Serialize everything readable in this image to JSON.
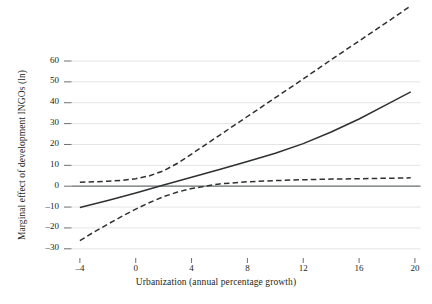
{
  "chart_data": {
    "type": "line",
    "title": "",
    "xlabel": "Urbanization (annual percentage growth)",
    "ylabel": "Marginal effect of development INGOs (ln)",
    "xlim": [
      -4.6,
      20.4
    ],
    "ylim": [
      -33,
      88
    ],
    "xticks": [
      -4,
      0,
      4,
      8,
      12,
      16,
      20
    ],
    "xtick_labels": [
      "–4",
      "0",
      "4",
      "8",
      "12",
      "16",
      "20"
    ],
    "yticks": [
      -30,
      -20,
      -10,
      0,
      10,
      20,
      30,
      40,
      50,
      60
    ],
    "ytick_labels": [
      "–30",
      "–20",
      "–10",
      "0",
      "10",
      "20",
      "30",
      "40",
      "50",
      "60"
    ],
    "grid": true,
    "grid_axis": "y",
    "grid_color": "#d9dadb",
    "legend": "none",
    "zero_line": {
      "value": 0,
      "style": "solid",
      "color": "#6e7072",
      "x_start": -4.6,
      "x_end": 20.4
    },
    "series": [
      {
        "name": "Marginal effect",
        "style": "solid",
        "color": "#2f3032",
        "width": 1.5,
        "x": [
          -4,
          -2,
          0,
          2,
          4,
          6,
          8,
          10,
          12,
          14,
          16,
          18,
          19.7
        ],
        "values": [
          -10.2,
          -6.9,
          -3.3,
          0.6,
          4.3,
          8.0,
          11.8,
          15.8,
          20.4,
          26.0,
          32.2,
          39.2,
          45.2
        ]
      },
      {
        "name": "Upper 95% confidence bound",
        "style": "dashed",
        "color": "#2f3032",
        "width": 1.5,
        "x": [
          -4,
          -3,
          -2,
          -1,
          0,
          1,
          2,
          3,
          4,
          6,
          8,
          10,
          12,
          14,
          16,
          18,
          19.7
        ],
        "values": [
          1.9,
          2.1,
          2.4,
          2.8,
          3.6,
          5.0,
          7.4,
          11.0,
          15.4,
          24.4,
          33.4,
          42.4,
          51.4,
          60.6,
          69.6,
          78.6,
          86.4
        ]
      },
      {
        "name": "Lower 95% confidence bound",
        "style": "dashed",
        "color": "#2f3032",
        "width": 1.5,
        "x": [
          -4,
          -3,
          -2,
          -1,
          0,
          1,
          2,
          3,
          4,
          6,
          8,
          10,
          12,
          14,
          16,
          18,
          19.7
        ],
        "values": [
          -26.1,
          -22.0,
          -18.2,
          -14.5,
          -11.0,
          -7.8,
          -5.0,
          -2.8,
          -1.1,
          1.1,
          2.1,
          2.7,
          3.1,
          3.4,
          3.6,
          3.8,
          4.0
        ]
      }
    ]
  }
}
